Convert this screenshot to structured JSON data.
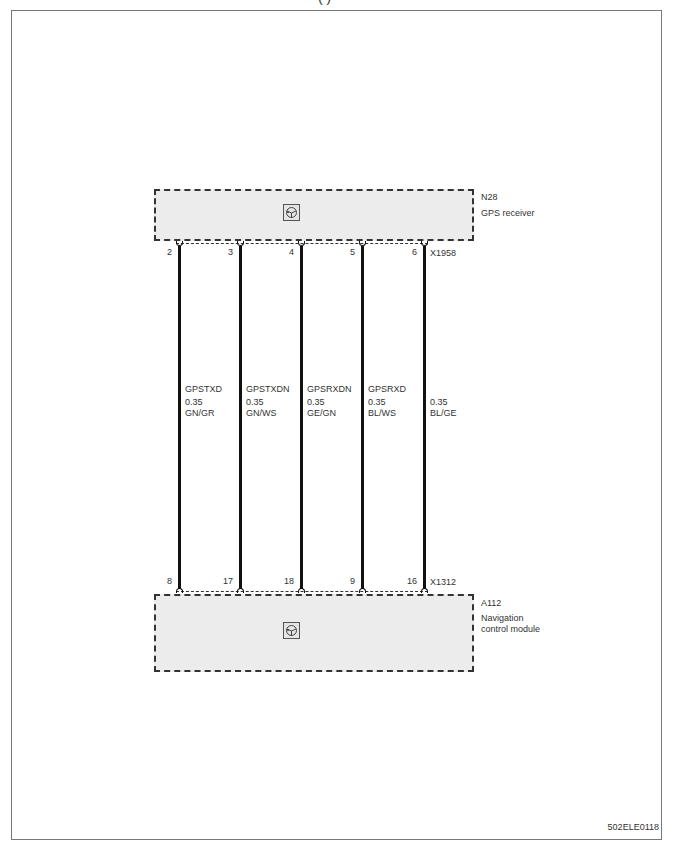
{
  "diagram": {
    "figure_id": "502ELE0118",
    "title_fragment": "( )",
    "components": {
      "top": {
        "code": "N28",
        "name": "GPS receiver",
        "connector": "X1958",
        "icon": "module-symbol-icon"
      },
      "bottom": {
        "code": "A112",
        "name_line1": "Navigation",
        "name_line2": "control module",
        "connector": "X1312",
        "icon": "module-symbol-icon"
      }
    },
    "wires": [
      {
        "signal": "GPSTXD",
        "gauge": "0.35",
        "color": "GN/GR",
        "top_pin": "2",
        "bottom_pin": "8"
      },
      {
        "signal": "GPSTXDN",
        "gauge": "0.35",
        "color": "GN/WS",
        "top_pin": "3",
        "bottom_pin": "17"
      },
      {
        "signal": "GPSRXDN",
        "gauge": "0.35",
        "color": "GE/GN",
        "top_pin": "4",
        "bottom_pin": "18"
      },
      {
        "signal": "GPSRXD",
        "gauge": "0.35",
        "color": "BL/WS",
        "top_pin": "5",
        "bottom_pin": "9"
      },
      {
        "signal": "",
        "gauge": "0.35",
        "color": "BL/GE",
        "top_pin": "6",
        "bottom_pin": "16"
      }
    ]
  }
}
